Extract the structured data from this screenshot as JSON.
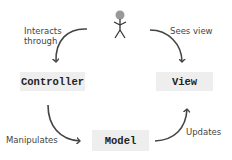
{
  "diagram": {
    "actor": {
      "icon": "stick-figure-user-icon"
    },
    "nodes": {
      "controller": {
        "label": "Controller"
      },
      "view": {
        "label": "View"
      },
      "model": {
        "label": "Model"
      }
    },
    "edges": {
      "user_to_controller": {
        "label_line1": "Interacts",
        "label_line2": "through"
      },
      "user_to_view": {
        "label": "Sees view"
      },
      "controller_to_model": {
        "label": "Manipulates"
      },
      "model_to_view": {
        "label": "Updates"
      }
    },
    "colors": {
      "box_fill": "#eeeeee",
      "arrow": "#444444",
      "head": "#999999",
      "text": "#444444"
    }
  }
}
